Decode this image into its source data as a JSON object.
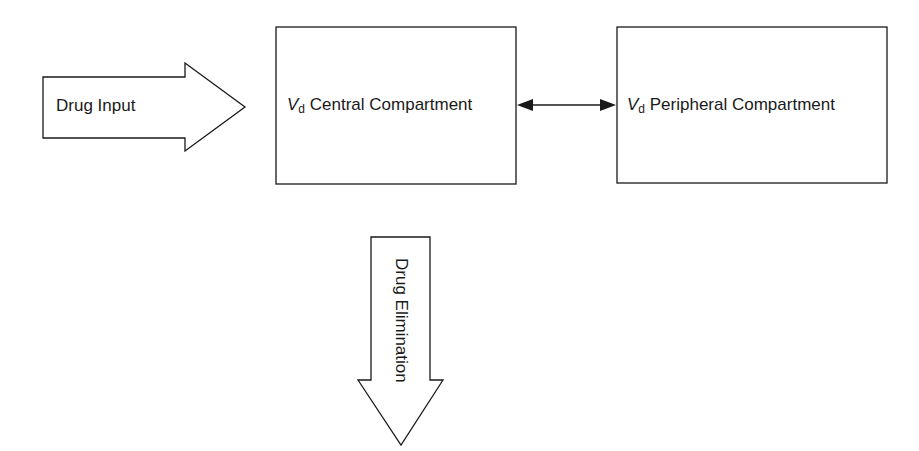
{
  "diagram": {
    "title": "",
    "nodes": {
      "input": {
        "label": "Drug Input"
      },
      "central": {
        "symbol": "V",
        "subscript": "d",
        "label": "Central Compartment"
      },
      "peripheral": {
        "symbol": "V",
        "subscript": "d",
        "label": "Peripheral Compartment"
      },
      "elimination": {
        "label": "Drug Elimination"
      }
    },
    "edges": [
      {
        "from": "input",
        "to": "central",
        "type": "block-arrow"
      },
      {
        "from": "central",
        "to": "peripheral",
        "type": "bidirectional"
      },
      {
        "from": "central",
        "to": "elimination",
        "type": "block-arrow"
      }
    ],
    "colors": {
      "stroke": "#1a1a1a",
      "fill": "#ffffff"
    }
  }
}
